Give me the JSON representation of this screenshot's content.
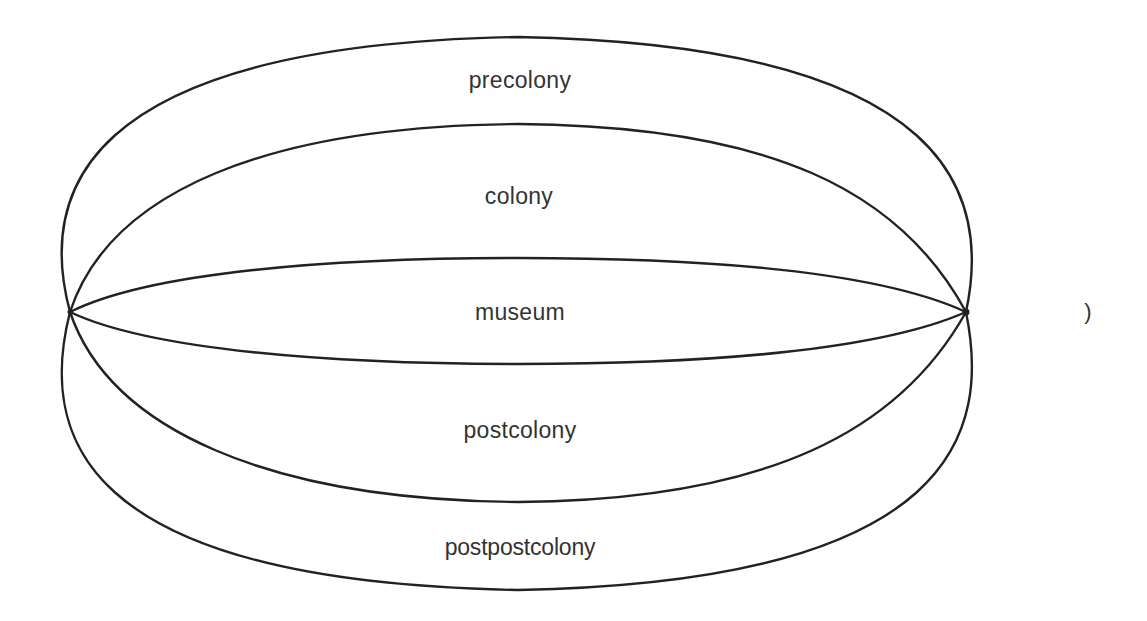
{
  "diagram": {
    "title": "",
    "regions": [
      {
        "id": "precolony",
        "label": "precolony"
      },
      {
        "id": "colony",
        "label": "colony"
      },
      {
        "id": "museum",
        "label": "museum"
      },
      {
        "id": "postcolony",
        "label": "postcolony"
      },
      {
        "id": "postpostcolony",
        "label": "postpostcolony"
      }
    ],
    "stray_glyph": ")",
    "stroke_color": "#222222",
    "text_color": "#333333",
    "background": "#ffffff"
  }
}
